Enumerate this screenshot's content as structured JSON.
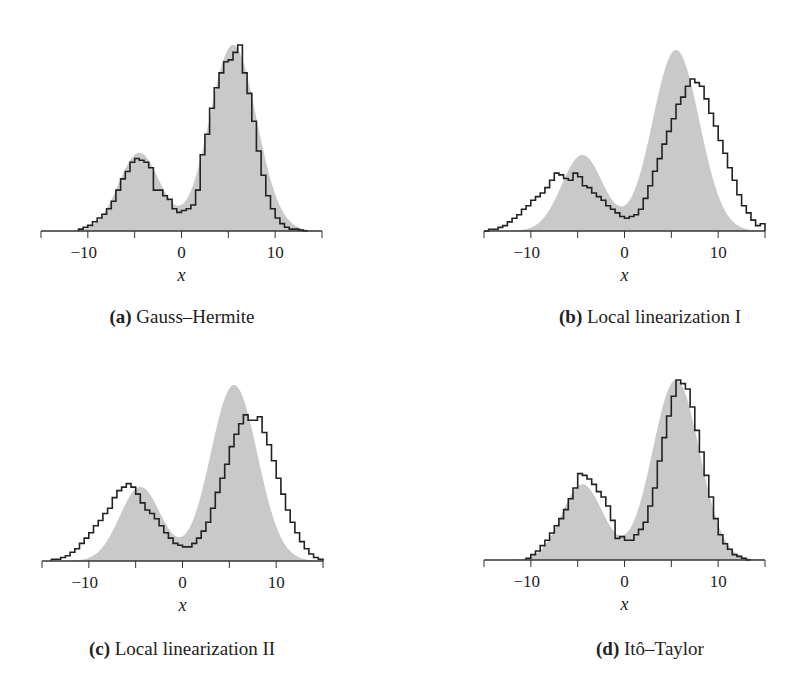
{
  "figure": {
    "panels": [
      {
        "id": "a",
        "label": "(a)",
        "title": "Gauss–Hermite",
        "xlabel": "x"
      },
      {
        "id": "b",
        "label": "(b)",
        "title": "Local linearization I",
        "xlabel": "x"
      },
      {
        "id": "c",
        "label": "(c)",
        "title": "Local linearization II",
        "xlabel": "x"
      },
      {
        "id": "d",
        "label": "(d)",
        "title": "Itô–Taylor",
        "xlabel": "x"
      }
    ],
    "tick_labels": [
      "−10",
      "0",
      "10"
    ],
    "colors": {
      "density_fill": "#c9c9c9",
      "histogram_line": "#222222",
      "axis": "#333333"
    }
  },
  "chart_data": [
    {
      "type": "area+histogram",
      "title": "(a) Gauss–Hermite",
      "xlabel": "x",
      "ylabel": "",
      "xlim": [
        -15,
        15
      ],
      "xticks": [
        -10,
        0,
        10
      ],
      "grid": false,
      "legend": "none",
      "density": {
        "name": "reference density (gray)",
        "modes": [
          -4.5,
          5.5
        ],
        "relative_peak_heights": [
          0.42,
          1.0
        ]
      },
      "histogram": {
        "name": "approximation (step line)",
        "x": [
          -11,
          -10.5,
          -10,
          -9.5,
          -9,
          -8.5,
          -8,
          -7.5,
          -7,
          -6.5,
          -6,
          -5.5,
          -5,
          -4.5,
          -4,
          -3.5,
          -3,
          -2.5,
          -2,
          -1.5,
          -1,
          -0.5,
          0,
          0.5,
          1,
          1.5,
          2,
          2.5,
          3,
          3.5,
          4,
          4.5,
          5,
          5.5,
          6,
          6.5,
          7,
          7.5,
          8,
          8.5,
          9,
          9.5,
          10,
          10.5,
          11,
          11.5,
          12,
          12.5,
          13
        ],
        "values": [
          0.01,
          0.02,
          0.03,
          0.05,
          0.07,
          0.09,
          0.12,
          0.16,
          0.22,
          0.28,
          0.32,
          0.37,
          0.39,
          0.38,
          0.37,
          0.34,
          0.22,
          0.22,
          0.19,
          0.17,
          0.12,
          0.1,
          0.11,
          0.12,
          0.14,
          0.22,
          0.41,
          0.52,
          0.66,
          0.77,
          0.85,
          0.91,
          0.92,
          0.96,
          1.0,
          0.85,
          0.74,
          0.59,
          0.43,
          0.3,
          0.19,
          0.12,
          0.07,
          0.04,
          0.02,
          0.01,
          0.01,
          0.005,
          0.0
        ]
      }
    },
    {
      "type": "area+histogram",
      "title": "(b) Local linearization I",
      "xlabel": "x",
      "ylabel": "",
      "xlim": [
        -15,
        15
      ],
      "xticks": [
        -10,
        0,
        10
      ],
      "grid": false,
      "legend": "none",
      "density": {
        "name": "reference density (gray)",
        "modes": [
          -4.5,
          5.5
        ],
        "relative_peak_heights": [
          0.42,
          1.0
        ]
      },
      "histogram": {
        "name": "approximation (step line)",
        "x": [
          -15,
          -14.5,
          -14,
          -13.5,
          -13,
          -12.5,
          -12,
          -11.5,
          -11,
          -10.5,
          -10,
          -9.5,
          -9,
          -8.5,
          -8,
          -7.5,
          -7,
          -6.5,
          -6,
          -5.5,
          -5,
          -4.5,
          -4,
          -3.5,
          -3,
          -2.5,
          -2,
          -1.5,
          -1,
          -0.5,
          0,
          0.5,
          1,
          1.5,
          2,
          2.5,
          3,
          3.5,
          4,
          4.5,
          5,
          5.5,
          6,
          6.5,
          7,
          7.5,
          8,
          8.5,
          9,
          9.5,
          10,
          10.5,
          11,
          11.5,
          12,
          12.5,
          13,
          13.5,
          14,
          14.5
        ],
        "values": [
          0.0,
          0.01,
          0.01,
          0.02,
          0.03,
          0.05,
          0.07,
          0.09,
          0.12,
          0.14,
          0.17,
          0.19,
          0.21,
          0.24,
          0.28,
          0.32,
          0.31,
          0.29,
          0.28,
          0.32,
          0.3,
          0.25,
          0.24,
          0.21,
          0.19,
          0.17,
          0.14,
          0.12,
          0.1,
          0.08,
          0.07,
          0.08,
          0.09,
          0.12,
          0.18,
          0.25,
          0.33,
          0.4,
          0.48,
          0.55,
          0.62,
          0.7,
          0.74,
          0.8,
          0.84,
          0.82,
          0.8,
          0.73,
          0.65,
          0.58,
          0.5,
          0.43,
          0.35,
          0.28,
          0.2,
          0.14,
          0.1,
          0.06,
          0.03,
          0.04
        ]
      }
    },
    {
      "type": "area+histogram",
      "title": "(c) Local linearization II",
      "xlabel": "x",
      "ylabel": "",
      "xlim": [
        -15,
        15
      ],
      "xticks": [
        -10,
        0,
        10
      ],
      "grid": false,
      "legend": "none",
      "density": {
        "name": "reference density (gray)",
        "modes": [
          -4.5,
          5.5
        ],
        "relative_peak_heights": [
          0.42,
          1.0
        ]
      },
      "histogram": {
        "name": "approximation (step line)",
        "x": [
          -14,
          -13.5,
          -13,
          -12.5,
          -12,
          -11.5,
          -11,
          -10.5,
          -10,
          -9.5,
          -9,
          -8.5,
          -8,
          -7.5,
          -7,
          -6.5,
          -6,
          -5.5,
          -5,
          -4.5,
          -4,
          -3.5,
          -3,
          -2.5,
          -2,
          -1.5,
          -1,
          -0.5,
          0,
          0.5,
          1,
          1.5,
          2,
          2.5,
          3,
          3.5,
          4,
          4.5,
          5,
          5.5,
          6,
          6.5,
          7,
          7.5,
          8,
          8.5,
          9,
          9.5,
          10,
          10.5,
          11,
          11.5,
          12,
          12.5,
          13,
          13.5,
          14,
          14.5
        ],
        "values": [
          0.01,
          0.01,
          0.02,
          0.03,
          0.05,
          0.07,
          0.1,
          0.13,
          0.16,
          0.2,
          0.23,
          0.27,
          0.3,
          0.36,
          0.4,
          0.42,
          0.44,
          0.42,
          0.38,
          0.33,
          0.29,
          0.27,
          0.24,
          0.2,
          0.16,
          0.13,
          0.1,
          0.09,
          0.08,
          0.08,
          0.1,
          0.13,
          0.17,
          0.22,
          0.3,
          0.39,
          0.47,
          0.55,
          0.65,
          0.72,
          0.78,
          0.83,
          0.8,
          0.8,
          0.82,
          0.73,
          0.66,
          0.57,
          0.47,
          0.38,
          0.29,
          0.22,
          0.16,
          0.11,
          0.07,
          0.04,
          0.02,
          0.01
        ]
      }
    },
    {
      "type": "area+histogram",
      "title": "(d) Itô–Taylor",
      "xlabel": "x",
      "ylabel": "",
      "xlim": [
        -15,
        15
      ],
      "xticks": [
        -10,
        0,
        10
      ],
      "grid": false,
      "legend": "none",
      "density": {
        "name": "reference density (gray)",
        "modes": [
          -4.5,
          5.5
        ],
        "relative_peak_heights": [
          0.42,
          1.0
        ]
      },
      "histogram": {
        "name": "approximation (step line)",
        "x": [
          -10.5,
          -10,
          -9.5,
          -9,
          -8.5,
          -8,
          -7.5,
          -7,
          -6.5,
          -6,
          -5.5,
          -5,
          -4.5,
          -4,
          -3.5,
          -3,
          -2.5,
          -2,
          -1.5,
          -1,
          -0.5,
          0,
          0.5,
          1,
          1.5,
          2,
          2.5,
          3,
          3.5,
          4,
          4.5,
          5,
          5.5,
          6,
          6.5,
          7,
          7.5,
          8,
          8.5,
          9,
          9.5,
          10,
          10.5,
          11,
          11.5,
          12,
          12.5,
          13
        ],
        "values": [
          0.01,
          0.03,
          0.05,
          0.08,
          0.11,
          0.15,
          0.19,
          0.23,
          0.28,
          0.34,
          0.4,
          0.48,
          0.47,
          0.45,
          0.42,
          0.38,
          0.35,
          0.3,
          0.22,
          0.12,
          0.13,
          0.11,
          0.11,
          0.14,
          0.17,
          0.21,
          0.3,
          0.4,
          0.55,
          0.68,
          0.8,
          0.91,
          1.0,
          0.98,
          0.95,
          0.85,
          0.72,
          0.6,
          0.47,
          0.35,
          0.23,
          0.14,
          0.09,
          0.06,
          0.03,
          0.02,
          0.01,
          0.0
        ]
      }
    }
  ]
}
